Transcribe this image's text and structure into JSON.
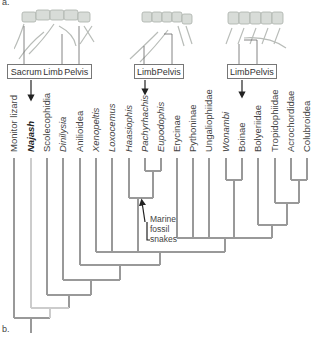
{
  "panel_labels": {
    "a": "a.",
    "b": "b."
  },
  "skeleton_boxes": [
    {
      "id": "najash",
      "labels": [
        "Sacrum",
        "Limb",
        "Pelvis"
      ]
    },
    {
      "id": "marine",
      "labels": [
        "Limb",
        "Pelvis"
      ]
    },
    {
      "id": "wonambi-boinae",
      "labels": [
        "Limb",
        "Pelvis"
      ]
    }
  ],
  "taxa": [
    {
      "name": "Monitor lizard",
      "style": "normal"
    },
    {
      "name": "Najash",
      "style": "bold-italic"
    },
    {
      "name": "Scolecophidia",
      "style": "normal"
    },
    {
      "name": "Dinilysia",
      "style": "italic"
    },
    {
      "name": "Anilioidea",
      "style": "normal"
    },
    {
      "name": "Xenopeltis",
      "style": "italic"
    },
    {
      "name": "Loxocemus",
      "style": "italic"
    },
    {
      "name": "Haasiophis",
      "style": "italic"
    },
    {
      "name": "Pachyrhachis",
      "style": "italic"
    },
    {
      "name": "Eupodophis",
      "style": "italic"
    },
    {
      "name": "Erycinae",
      "style": "normal"
    },
    {
      "name": "Pythoninae",
      "style": "normal"
    },
    {
      "name": "Ungaliophiidae",
      "style": "normal"
    },
    {
      "name": "Wonambi",
      "style": "italic"
    },
    {
      "name": "Boinae",
      "style": "normal"
    },
    {
      "name": "Bolyeriidae",
      "style": "normal"
    },
    {
      "name": "Tropidophiidae",
      "style": "normal"
    },
    {
      "name": "Acrochordidae",
      "style": "normal"
    },
    {
      "name": "Colubroidea",
      "style": "normal"
    }
  ],
  "annotation": {
    "line1": "Marine",
    "line2": "fossil",
    "line3": "snakes"
  },
  "colors": {
    "branch": "#999999",
    "najash_branch": "#cccccc",
    "arrow": "#222222"
  }
}
